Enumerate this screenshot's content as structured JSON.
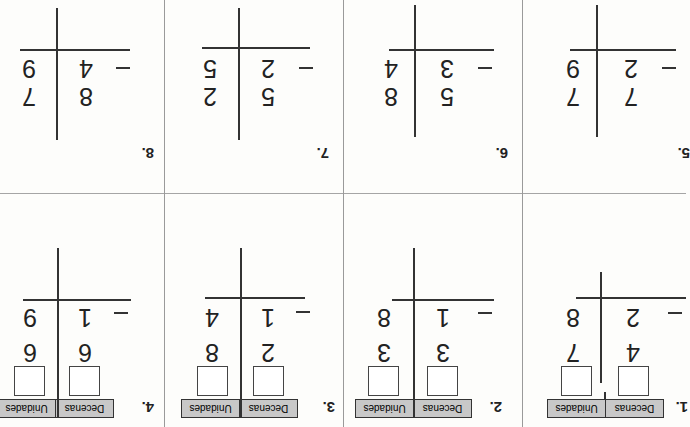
{
  "orientation": "rotated-180",
  "column_headers": {
    "tens": "Decenas",
    "ones": "Unidades"
  },
  "problems_with_boxes": [
    {
      "number": "1.",
      "top": [
        "4",
        "7"
      ],
      "bottom": [
        "2",
        "8"
      ],
      "operator": "−"
    },
    {
      "number": "2.",
      "top": [
        "3",
        "3"
      ],
      "bottom": [
        "1",
        "8"
      ],
      "operator": "−"
    },
    {
      "number": "3.",
      "top": [
        "2",
        "8"
      ],
      "bottom": [
        "1",
        "4"
      ],
      "operator": "−"
    },
    {
      "number": "4.",
      "top": [
        "6",
        "6"
      ],
      "bottom": [
        "1",
        "9"
      ],
      "operator": "−"
    }
  ],
  "problems": [
    {
      "number": "5.",
      "top": [
        "7",
        "7"
      ],
      "bottom": [
        "2",
        "9"
      ],
      "operator": "−"
    },
    {
      "number": "6.",
      "top": [
        "5",
        "8"
      ],
      "bottom": [
        "3",
        "4"
      ],
      "operator": "−"
    },
    {
      "number": "7.",
      "top": [
        "5",
        "2"
      ],
      "bottom": [
        "2",
        "5"
      ],
      "operator": "−"
    },
    {
      "number": "8.",
      "top": [
        "8",
        "7"
      ],
      "bottom": [
        "4",
        "9"
      ],
      "operator": "−"
    }
  ]
}
